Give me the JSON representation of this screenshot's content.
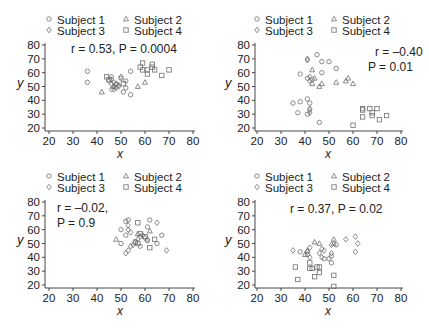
{
  "figure": {
    "marker_color": "#6f6f6f",
    "axis_color": "#333333",
    "legend_labels": [
      "Subject 1",
      "Subject 2",
      "Subject 3",
      "Subject 4"
    ],
    "legend_markers": [
      "circle",
      "triangle",
      "diamond",
      "square"
    ]
  },
  "chart_data": [
    {
      "type": "scatter",
      "panel": "top-left",
      "title": "",
      "xlabel": "x",
      "ylabel": "y",
      "xlim": [
        20,
        80
      ],
      "ylim": [
        20,
        80
      ],
      "xticks": [
        20,
        30,
        40,
        50,
        60,
        70,
        80
      ],
      "yticks": [
        20,
        30,
        40,
        50,
        60,
        70,
        80
      ],
      "annotation": [
        "r = 0.53, P = 0.0004"
      ],
      "legend_position": "top",
      "series": [
        {
          "name": "Subject 1",
          "marker": "circle",
          "points": [
            [
              36,
              61
            ],
            [
              36,
              53
            ],
            [
              54,
              61
            ],
            [
              54,
              44
            ],
            [
              51,
              46
            ],
            [
              52,
              49
            ],
            [
              52,
              54
            ],
            [
              46,
              57
            ],
            [
              50,
              56
            ]
          ]
        },
        {
          "name": "Subject 2",
          "marker": "triangle",
          "points": [
            [
              42,
              46
            ],
            [
              57,
              50
            ],
            [
              60,
              53
            ],
            [
              48,
              52
            ],
            [
              47,
              50
            ]
          ]
        },
        {
          "name": "Subject 3",
          "marker": "diamond",
          "points": [
            [
              46,
              48
            ],
            [
              47,
              50
            ],
            [
              48,
              52
            ],
            [
              49,
              50
            ],
            [
              47,
              53
            ],
            [
              46,
              55
            ],
            [
              48,
              49
            ],
            [
              49,
              51
            ],
            [
              46,
              52
            ],
            [
              47,
              48
            ],
            [
              50,
              57
            ],
            [
              45,
              54
            ]
          ]
        },
        {
          "name": "Subject 4",
          "marker": "square",
          "points": [
            [
              44,
              57
            ],
            [
              45,
              55
            ],
            [
              59,
              67
            ],
            [
              58,
              64
            ],
            [
              59,
              62
            ],
            [
              61,
              62
            ],
            [
              61,
              59
            ],
            [
              63,
              66
            ],
            [
              63,
              64
            ],
            [
              64,
              62
            ],
            [
              67,
              58
            ],
            [
              70,
              62
            ],
            [
              51,
              52
            ]
          ]
        }
      ]
    },
    {
      "type": "scatter",
      "panel": "top-right",
      "title": "",
      "xlabel": "x",
      "ylabel": "y",
      "xlim": [
        20,
        80
      ],
      "ylim": [
        20,
        80
      ],
      "xticks": [
        20,
        30,
        40,
        50,
        60,
        70,
        80
      ],
      "yticks": [
        20,
        30,
        40,
        50,
        60,
        70,
        80
      ],
      "annotation": [
        "r = –0.40",
        "P = 0.01"
      ],
      "legend_position": "top",
      "series": [
        {
          "name": "Subject 1",
          "marker": "circle",
          "points": [
            [
              45,
              73
            ],
            [
              47,
              68
            ],
            [
              50,
              68
            ],
            [
              53,
              63
            ],
            [
              38,
              59
            ],
            [
              47,
              60
            ],
            [
              41,
              56
            ],
            [
              43,
              55
            ],
            [
              35,
              38
            ],
            [
              38,
              39
            ],
            [
              37,
              31
            ],
            [
              41,
              41
            ],
            [
              42,
              38
            ],
            [
              41,
              30
            ],
            [
              46,
              24
            ]
          ]
        },
        {
          "name": "Subject 2",
          "marker": "triangle",
          "points": [
            [
              43,
              62
            ],
            [
              44,
              56
            ],
            [
              43,
              52
            ],
            [
              47,
              52
            ],
            [
              53,
              53
            ],
            [
              57,
              54
            ],
            [
              58,
              56
            ],
            [
              60,
              52
            ],
            [
              46,
              50
            ]
          ]
        },
        {
          "name": "Subject 3",
          "marker": "diamond",
          "points": [
            [
              41,
              70
            ],
            [
              41,
              69
            ],
            [
              42,
              57
            ],
            [
              42,
              54
            ],
            [
              42,
              33
            ],
            [
              42,
              31
            ],
            [
              42,
              34
            ]
          ]
        },
        {
          "name": "Subject 4",
          "marker": "square",
          "points": [
            [
              64,
              34
            ],
            [
              64,
              33
            ],
            [
              67,
              34
            ],
            [
              68,
              31
            ],
            [
              68,
              29
            ],
            [
              70,
              34
            ],
            [
              71,
              26
            ],
            [
              74,
              29
            ],
            [
              64,
              28
            ],
            [
              60,
              22
            ]
          ]
        }
      ]
    },
    {
      "type": "scatter",
      "panel": "bottom-left",
      "title": "",
      "xlabel": "x",
      "ylabel": "y",
      "xlim": [
        20,
        80
      ],
      "ylim": [
        20,
        80
      ],
      "xticks": [
        20,
        30,
        40,
        50,
        60,
        70,
        80
      ],
      "yticks": [
        20,
        30,
        40,
        50,
        60,
        70,
        80
      ],
      "annotation": [
        "r = –0.02,",
        "P = 0.9"
      ],
      "legend_position": "top",
      "series": [
        {
          "name": "Subject 1",
          "marker": "circle",
          "points": [
            [
              52,
              66
            ],
            [
              53,
              67
            ],
            [
              50,
              60
            ],
            [
              52,
              56
            ],
            [
              50,
              50
            ],
            [
              61,
              62
            ],
            [
              62,
              67
            ],
            [
              67,
              56
            ],
            [
              65,
              50
            ],
            [
              58,
              48
            ],
            [
              61,
              52
            ]
          ]
        },
        {
          "name": "Subject 2",
          "marker": "triangle",
          "points": [
            [
              48,
              53
            ],
            [
              62,
              59
            ],
            [
              57,
              57
            ]
          ]
        },
        {
          "name": "Subject 3",
          "marker": "diamond",
          "points": [
            [
              52,
              43
            ],
            [
              53,
              45
            ],
            [
              54,
              48
            ],
            [
              55,
              49
            ],
            [
              56,
              51
            ],
            [
              57,
              53
            ],
            [
              58,
              55
            ],
            [
              59,
              56
            ],
            [
              60,
              54
            ],
            [
              61,
              53
            ],
            [
              53,
              60
            ],
            [
              54,
              58
            ],
            [
              65,
              65
            ],
            [
              69,
              45
            ],
            [
              53,
              63
            ]
          ]
        },
        {
          "name": "Subject 4",
          "marker": "square",
          "points": [
            [
              57,
              65
            ],
            [
              56,
              51
            ],
            [
              57,
              50
            ],
            [
              58,
              57
            ],
            [
              62,
              47
            ],
            [
              64,
              53
            ],
            [
              60,
              55
            ]
          ]
        }
      ]
    },
    {
      "type": "scatter",
      "panel": "bottom-right",
      "title": "",
      "xlabel": "x",
      "ylabel": "y",
      "xlim": [
        20,
        80
      ],
      "ylim": [
        20,
        80
      ],
      "xticks": [
        20,
        30,
        40,
        50,
        60,
        70,
        80
      ],
      "yticks": [
        20,
        30,
        40,
        50,
        60,
        70,
        80
      ],
      "annotation": [
        "r = 0.37, P = 0.02"
      ],
      "legend_position": "top",
      "series": [
        {
          "name": "Subject 1",
          "marker": "circle",
          "points": [
            [
              38,
              44
            ],
            [
              41,
              42
            ],
            [
              48,
              39
            ],
            [
              50,
              39
            ],
            [
              51,
              36
            ],
            [
              51,
              41
            ],
            [
              53,
              49
            ]
          ]
        },
        {
          "name": "Subject 2",
          "marker": "triangle",
          "points": [
            [
              44,
              51
            ],
            [
              46,
              50
            ],
            [
              52,
              53
            ],
            [
              52,
              50
            ],
            [
              40,
              42
            ],
            [
              41,
              45
            ]
          ]
        },
        {
          "name": "Subject 3",
          "marker": "diamond",
          "points": [
            [
              35,
              45
            ],
            [
              41,
              44
            ],
            [
              42,
              47
            ],
            [
              42,
              40
            ],
            [
              46,
              43
            ],
            [
              47,
              46
            ],
            [
              47,
              40
            ],
            [
              48,
              45
            ],
            [
              51,
              43
            ],
            [
              51,
              49
            ],
            [
              57,
              53
            ],
            [
              61,
              55
            ],
            [
              61,
              44
            ],
            [
              62,
              50
            ]
          ]
        },
        {
          "name": "Subject 4",
          "marker": "square",
          "points": [
            [
              36,
              33
            ],
            [
              37,
              24
            ],
            [
              42,
              36
            ],
            [
              42,
              32
            ],
            [
              43,
              32
            ],
            [
              44,
              26
            ],
            [
              45,
              33
            ],
            [
              46,
              33
            ],
            [
              46,
              29
            ],
            [
              52,
              27
            ],
            [
              52,
              19
            ]
          ]
        }
      ]
    }
  ]
}
